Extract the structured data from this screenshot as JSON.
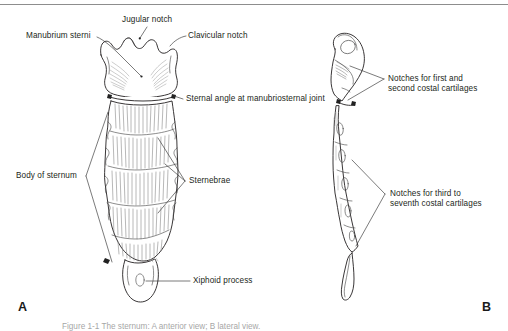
{
  "figure": {
    "subject": "Sternum",
    "panels": [
      {
        "id": "A",
        "letter": "A",
        "view": "anterior"
      },
      {
        "id": "B",
        "letter": "B",
        "view": "lateral"
      }
    ],
    "caption": "Figure 1-1  The sternum: A anterior view; B lateral view.",
    "colors": {
      "ink": "#231f20",
      "leader": "#3a3a3a",
      "shading": "#9a9a9a",
      "background": "#ffffff",
      "rule": "#8d8d8d"
    }
  },
  "labels": {
    "manubrium_sterni": "Manubrium sterni",
    "jugular_notch": "Jugular notch",
    "clavicular_notch": "Clavicular notch",
    "sternal_angle": "Sternal angle at manubriosternal joint",
    "body_of_sternum": "Body of sternum",
    "sternebrae": "Sternebrae",
    "xiphoid_process": "Xiphoid process",
    "notches_first_second_line1": "Notches for first and",
    "notches_first_second_line2": "second costal cartilages",
    "notches_third_seventh_line1": "Notches for third to",
    "notches_third_seventh_line2": "seventh costal cartilages"
  }
}
